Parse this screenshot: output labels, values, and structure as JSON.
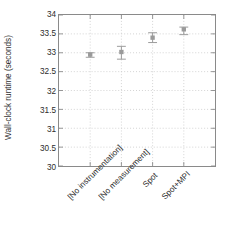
{
  "chart_data": {
    "type": "scatter",
    "title": "",
    "xlabel": "",
    "ylabel": "Wall-clock runtime (seconds)",
    "categories": [
      "[No instrumentation]",
      "[No measurement]",
      "Spot",
      "Spot+MPI"
    ],
    "values": [
      32.95,
      33.02,
      33.4,
      33.62
    ],
    "error_low": [
      32.88,
      32.83,
      33.27,
      33.48
    ],
    "error_high": [
      33.0,
      33.17,
      33.53,
      33.68
    ],
    "ylim": [
      30,
      34
    ],
    "yticks": [
      "30",
      "30.5",
      "31",
      "31.5",
      "32",
      "32.5",
      "33",
      "33.5",
      "34"
    ],
    "ytick_values": [
      30,
      30.5,
      31,
      31.5,
      32,
      32.5,
      33,
      33.5,
      34
    ],
    "grid": true,
    "grid_style": "dotted",
    "legend": "none",
    "marker_color": "#9a9a9a",
    "grid_color": "#c8c8c8",
    "frame_color": "#8a8a8a",
    "text_color": "#2b2b2b"
  }
}
